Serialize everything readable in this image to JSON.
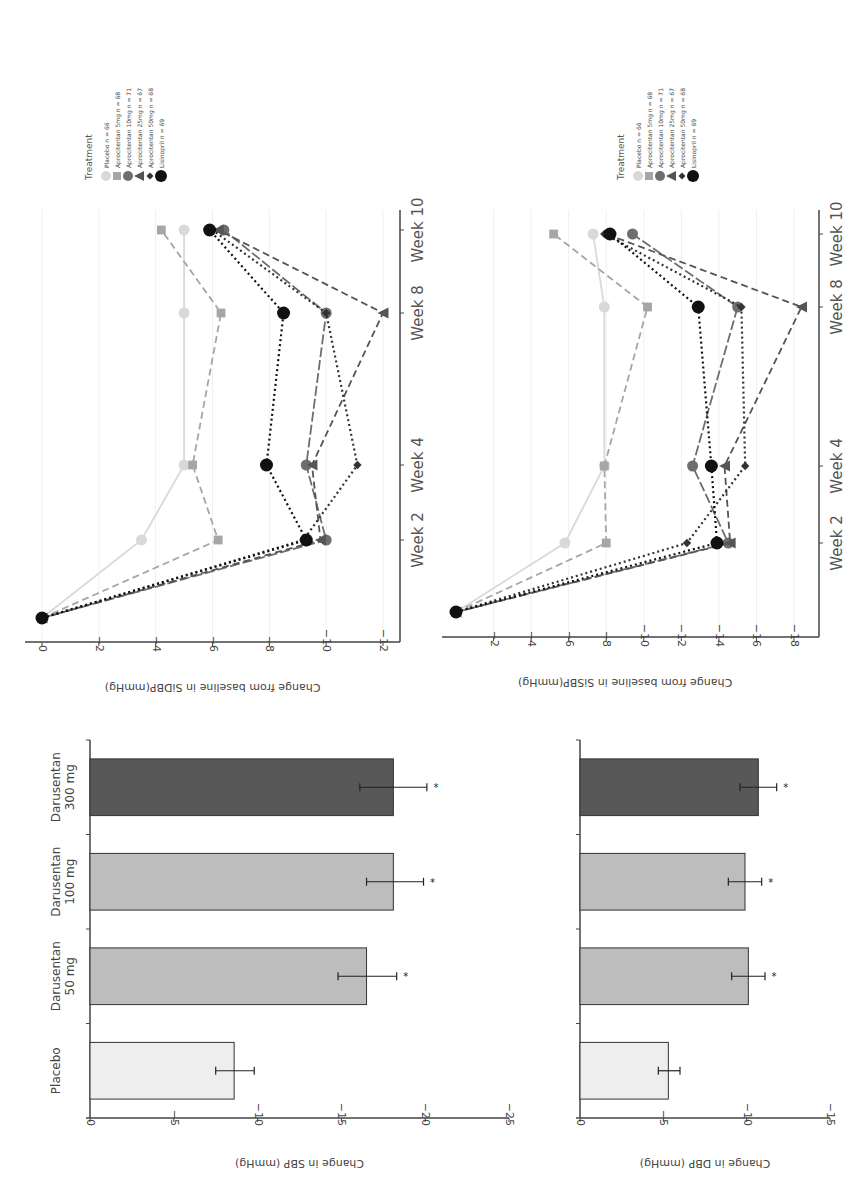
{
  "chart_data": [
    {
      "id": "sidbp",
      "type": "line",
      "title": "",
      "ylabel": "Change from baseline in SiDBP(mmHg)",
      "xlabel": "",
      "x": [
        "Baseline",
        "Week 2",
        "Week 4",
        "Week 8",
        "Week 10"
      ],
      "x_tick_labels": [
        "Week 2",
        "Week 4",
        "Week 8",
        "Week 10"
      ],
      "y_ticks": [
        0,
        -2,
        -4,
        -6,
        -8,
        -10,
        -12
      ],
      "ylim": [
        0,
        -12.5
      ],
      "grid": true,
      "legend_title": "Treatment",
      "legend_position": "top-right (rotated)",
      "series": [
        {
          "name": "Placebo n = 66",
          "marker": "circle",
          "style": "solid",
          "color": "#d9d9d9",
          "values": [
            0,
            -3.5,
            -5.0,
            -5.0,
            -5.0
          ]
        },
        {
          "name": "Aprocitentan 5mg n = 68",
          "marker": "square",
          "style": "dashed",
          "color": "#a6a6a6",
          "values": [
            0,
            -6.2,
            -5.3,
            -6.3,
            -4.2
          ]
        },
        {
          "name": "Aprocitentan 10mg n = 71",
          "marker": "circle",
          "style": "longdash",
          "color": "#6e6e6e",
          "values": [
            0,
            -10.0,
            -9.3,
            -10.0,
            -6.4
          ]
        },
        {
          "name": "Aprocitentan 25mg n = 67",
          "marker": "triangle",
          "style": "dashed",
          "color": "#555555",
          "values": [
            0,
            -9.8,
            -9.5,
            -12.0,
            -6.2
          ]
        },
        {
          "name": "Aprocitentan 50mg n = 68",
          "marker": "diamond",
          "style": "dotted",
          "color": "#333333",
          "values": [
            0,
            -9.2,
            -11.1,
            -10.0,
            -6.0
          ]
        },
        {
          "name": "Lisinopril n = 69",
          "marker": "circle",
          "style": "dotted",
          "color": "#111111",
          "values": [
            0,
            -9.3,
            -7.9,
            -8.5,
            -5.9
          ]
        }
      ]
    },
    {
      "id": "sisbp",
      "type": "line",
      "title": "",
      "ylabel": "Change from baseline in SiSBP(mmHg)",
      "xlabel": "",
      "x": [
        "Baseline",
        "Week 2",
        "Week 4",
        "Week 8",
        "Week 10"
      ],
      "x_tick_labels": [
        "Week 2",
        "Week 4",
        "Week 8",
        "Week 10"
      ],
      "y_ticks": [
        -2,
        -4,
        -6,
        -8,
        -10,
        -12,
        -14,
        -16,
        -18
      ],
      "ylim": [
        0,
        -19
      ],
      "grid": true,
      "legend_title": "Treatment",
      "legend_position": "top-right (rotated)",
      "series": [
        {
          "name": "Placebo n = 66",
          "marker": "circle",
          "style": "solid",
          "color": "#d9d9d9",
          "values": [
            0,
            -5.8,
            -7.9,
            -7.9,
            -7.3
          ]
        },
        {
          "name": "Aprocitentan 5mg n = 68",
          "marker": "square",
          "style": "dashed",
          "color": "#a6a6a6",
          "values": [
            0,
            -8.0,
            -7.9,
            -10.2,
            -5.2
          ]
        },
        {
          "name": "Aprocitentan 10mg n = 71",
          "marker": "circle",
          "style": "longdash",
          "color": "#6e6e6e",
          "values": [
            0,
            -14.5,
            -12.6,
            -15.0,
            -9.4
          ]
        },
        {
          "name": "Aprocitentan 25mg n = 67",
          "marker": "triangle",
          "style": "dashed",
          "color": "#555555",
          "values": [
            0,
            -14.6,
            -14.3,
            -18.4,
            -8.0
          ]
        },
        {
          "name": "Aprocitentan 50mg n = 68",
          "marker": "diamond",
          "style": "dotted",
          "color": "#333333",
          "values": [
            0,
            -12.3,
            -15.4,
            -15.2,
            -7.9
          ]
        },
        {
          "name": "Lisinopril n = 69",
          "marker": "circle",
          "style": "dotted",
          "color": "#111111",
          "values": [
            0,
            -13.9,
            -13.6,
            -12.9,
            -8.2
          ]
        }
      ]
    },
    {
      "id": "sbp",
      "type": "bar",
      "title": "",
      "ylabel": "Change in SBP (mmHg)",
      "xlabel": "",
      "categories": [
        "Placebo",
        "Darusentan 50 mg",
        "Darusentan 100 mg",
        "Darusentan 300 mg"
      ],
      "category_lines": [
        [
          "Placebo"
        ],
        [
          "Darusentan",
          "50 mg"
        ],
        [
          "Darusentan",
          "100 mg"
        ],
        [
          "Darusentan",
          "300 mg"
        ]
      ],
      "values": [
        -8.6,
        -16.5,
        -18.1,
        -18.1
      ],
      "error_low": [
        -7.5,
        -14.8,
        -16.5,
        -16.1
      ],
      "error_high": [
        -9.8,
        -18.3,
        -19.9,
        -20.1
      ],
      "significance": [
        "",
        "*",
        "*",
        "*"
      ],
      "bar_colors": [
        "#eeeeee",
        "#bdbdbd",
        "#bdbdbd",
        "#585858"
      ],
      "y_ticks": [
        0,
        -5,
        -10,
        -15,
        -20,
        -25
      ],
      "ylim": [
        0,
        -25
      ]
    },
    {
      "id": "dbp",
      "type": "bar",
      "title": "",
      "ylabel": "Change in DBP (mmHg)",
      "xlabel": "",
      "categories": [
        "Placebo",
        "Darusentan 50 mg",
        "Darusentan 100 mg",
        "Darusentan 300 mg"
      ],
      "values": [
        -5.3,
        -10.1,
        -9.9,
        -10.7
      ],
      "error_low": [
        -4.7,
        -9.1,
        -8.9,
        -9.6
      ],
      "error_high": [
        -6.0,
        -11.1,
        -10.9,
        -11.8
      ],
      "significance": [
        "",
        "*",
        "*",
        "*"
      ],
      "bar_colors": [
        "#eeeeee",
        "#bdbdbd",
        "#bdbdbd",
        "#585858"
      ],
      "y_ticks": [
        0,
        -5,
        -10,
        -15
      ],
      "ylim": [
        0,
        -15
      ]
    }
  ]
}
